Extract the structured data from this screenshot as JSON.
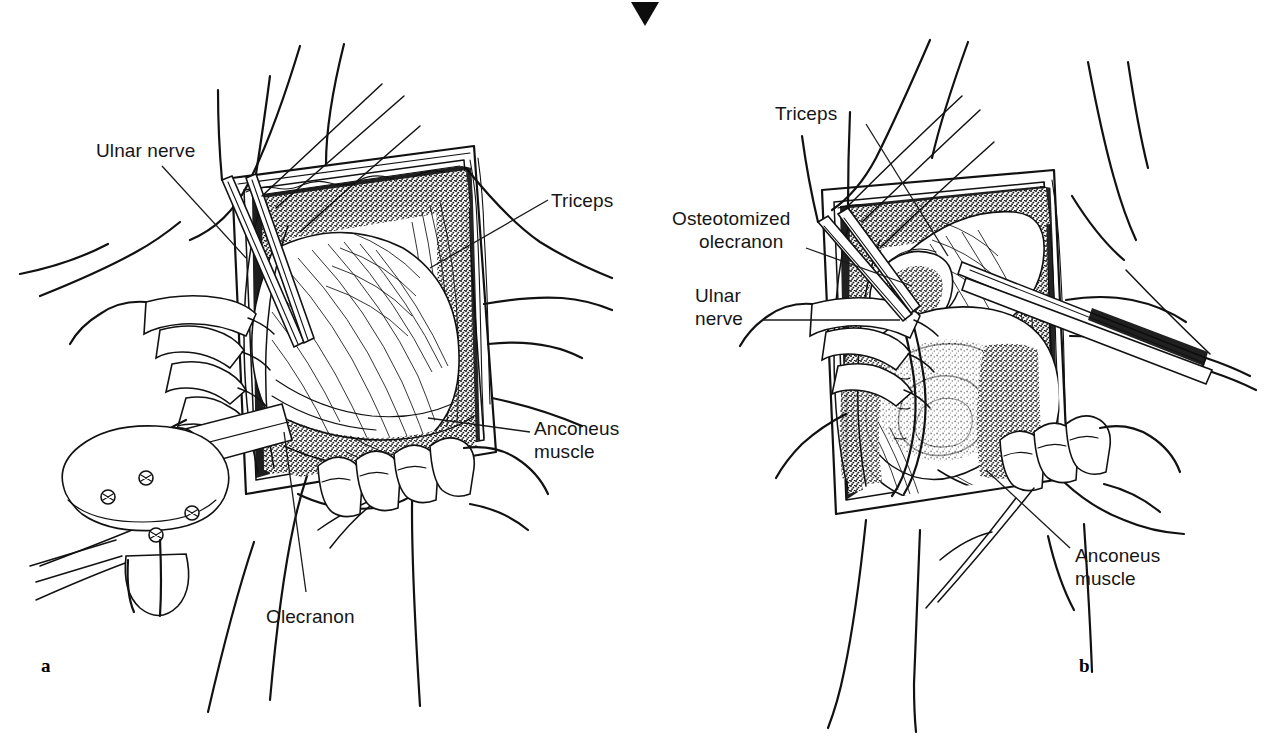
{
  "figure": {
    "kind": "surgical-anatomy-illustration",
    "background_color": "#ffffff",
    "ink_color": "#111111",
    "top_marker": {
      "name": "down-triangle-marker",
      "glyph": "▼",
      "color": "#000000"
    }
  },
  "panels": [
    {
      "id": "a",
      "letter": "a",
      "caption_letter_color": "#000000",
      "labels": [
        {
          "key": "ulnar_nerve",
          "text": "Ulnar nerve",
          "lines": [
            "Ulnar nerve"
          ]
        },
        {
          "key": "triceps",
          "text": "Triceps",
          "lines": [
            "Triceps"
          ]
        },
        {
          "key": "anconeus_muscle",
          "text": "Anconeus muscle",
          "lines": [
            "Anconeus",
            "muscle"
          ]
        },
        {
          "key": "olecranon",
          "text": "Olecranon",
          "lines": [
            "Olecranon"
          ]
        }
      ]
    },
    {
      "id": "b",
      "letter": "b",
      "caption_letter_color": "#000000",
      "labels": [
        {
          "key": "triceps",
          "text": "Triceps",
          "lines": [
            "Triceps"
          ]
        },
        {
          "key": "osteotomized_olecranon",
          "text": "Osteotomized olecranon",
          "lines": [
            "Osteotomized",
            "olecranon"
          ]
        },
        {
          "key": "ulnar_nerve",
          "text": "Ulnar nerve",
          "lines": [
            "Ulnar",
            "nerve"
          ]
        },
        {
          "key": "anconeus_muscle",
          "text": "Anconeus muscle",
          "lines": [
            "Anconeus",
            "muscle"
          ]
        }
      ]
    }
  ],
  "text": {
    "panel_a_ulnar_nerve": "Ulnar nerve",
    "panel_a_triceps": "Triceps",
    "panel_a_anconeus_line1": "Anconeus",
    "panel_a_anconeus_line2": "muscle",
    "panel_a_olecranon": "Olecranon",
    "panel_a_letter": "a",
    "panel_b_triceps": "Triceps",
    "panel_b_osteotomized_line1": "Osteotomized",
    "panel_b_osteotomized_line2": "olecranon",
    "panel_b_ulnar_line1": "Ulnar",
    "panel_b_ulnar_line2": "nerve",
    "panel_b_anconeus_line1": "Anconeus",
    "panel_b_anconeus_line2": "muscle",
    "panel_b_letter": "b",
    "top_marker_glyph": "▼"
  }
}
